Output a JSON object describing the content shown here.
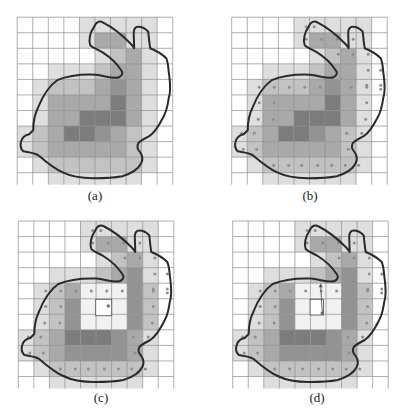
{
  "figure": {
    "grid": {
      "cols": 10,
      "rows": 11,
      "cell_size": 15.55
    },
    "shade_colors": [
      "#ffffff",
      "#dedede",
      "#c2c2c2",
      "#a9a9a9",
      "#939393",
      "#7c7c7c"
    ],
    "outline_color": "#2a2a2a",
    "dot_color": "#9a8a8a",
    "grid_line_color": "#8c8c8c",
    "panels": [
      {
        "id": "a",
        "label": "(a)",
        "origin": [
          17.2,
          17.2
        ],
        "dots": false
      },
      {
        "id": "b",
        "label": "(b)",
        "origin": [
          231.7,
          17.2
        ],
        "dots": true
      },
      {
        "id": "c",
        "label": "(c)",
        "origin": [
          18.3,
          221
        ],
        "dots": true,
        "hole": true,
        "box": true
      },
      {
        "id": "d",
        "label": "(d)",
        "origin": [
          232.7,
          221
        ],
        "dots": true,
        "hole": true,
        "box": true,
        "arrow": true
      }
    ],
    "shading_full": [
      [
        0,
        0,
        0,
        0,
        1,
        1,
        1,
        1,
        1,
        0
      ],
      [
        0,
        0,
        0,
        0,
        1,
        3,
        3,
        1,
        1,
        0
      ],
      [
        0,
        0,
        0,
        0,
        0,
        1,
        2,
        3,
        1,
        0
      ],
      [
        0,
        0,
        1,
        1,
        1,
        2,
        3,
        3,
        1,
        0
      ],
      [
        0,
        1,
        2,
        2,
        2,
        3,
        4,
        3,
        1,
        0
      ],
      [
        0,
        1,
        3,
        3,
        3,
        3,
        5,
        3,
        1,
        0
      ],
      [
        0,
        1,
        3,
        3,
        5,
        5,
        5,
        3,
        1,
        0
      ],
      [
        1,
        2,
        3,
        5,
        5,
        4,
        3,
        2,
        1,
        0
      ],
      [
        1,
        2,
        3,
        3,
        3,
        3,
        3,
        2,
        1,
        0
      ],
      [
        0,
        1,
        2,
        2,
        2,
        2,
        2,
        2,
        1,
        0
      ],
      [
        0,
        0,
        1,
        1,
        1,
        1,
        1,
        1,
        0,
        0
      ]
    ],
    "shading_hollow": [
      [
        0,
        0,
        0,
        0,
        1,
        1,
        1,
        1,
        1,
        0
      ],
      [
        0,
        0,
        0,
        0,
        1,
        3,
        3,
        1,
        1,
        0
      ],
      [
        0,
        0,
        0,
        0,
        0,
        1,
        2,
        3,
        1,
        0
      ],
      [
        0,
        0,
        1,
        1,
        1,
        2,
        3,
        4,
        1,
        0
      ],
      [
        0,
        1,
        2,
        3,
        0,
        0,
        0,
        4,
        2,
        0
      ],
      [
        0,
        1,
        2,
        4,
        0,
        0,
        0,
        4,
        2,
        0
      ],
      [
        0,
        1,
        2,
        4,
        0,
        0,
        0,
        4,
        2,
        0
      ],
      [
        1,
        2,
        3,
        5,
        5,
        5,
        4,
        3,
        1,
        0
      ],
      [
        1,
        2,
        3,
        4,
        4,
        4,
        4,
        3,
        1,
        0
      ],
      [
        0,
        1,
        2,
        2,
        2,
        2,
        2,
        2,
        1,
        0
      ],
      [
        0,
        0,
        1,
        1,
        1,
        1,
        1,
        1,
        0,
        0
      ]
    ],
    "hole_tint": "#f1f1f1",
    "dots_local": [
      [
        74.5,
        9.5
      ],
      [
        82.5,
        9.5
      ],
      [
        74.5,
        22
      ],
      [
        90,
        22
      ],
      [
        105.5,
        22
      ],
      [
        121.5,
        22
      ],
      [
        106.5,
        37
      ],
      [
        121.5,
        37
      ],
      [
        136.5,
        37
      ],
      [
        136.5,
        53
      ],
      [
        149,
        53
      ],
      [
        135,
        68
      ],
      [
        149,
        68
      ],
      [
        27.5,
        70
      ],
      [
        42.5,
        70
      ],
      [
        57.5,
        70
      ],
      [
        73,
        70
      ],
      [
        88.5,
        70
      ],
      [
        104,
        70
      ],
      [
        119.5,
        70
      ],
      [
        135,
        70
      ],
      [
        149,
        72
      ],
      [
        27.5,
        85.5
      ],
      [
        42.5,
        85.5
      ],
      [
        135,
        85.5
      ],
      [
        26.5,
        102
      ],
      [
        41.5,
        102
      ],
      [
        134,
        102
      ],
      [
        10,
        116
      ],
      [
        22.5,
        116
      ],
      [
        115,
        116
      ],
      [
        130,
        116
      ],
      [
        11.5,
        132
      ],
      [
        25,
        132
      ],
      [
        116.5,
        132
      ],
      [
        42,
        148
      ],
      [
        57,
        148
      ],
      [
        70,
        148
      ],
      [
        86,
        148
      ],
      [
        100,
        148
      ],
      [
        113.5,
        148
      ],
      [
        127,
        148
      ]
    ],
    "box_c": {
      "x": 77.4,
      "y": 78.3,
      "w": 16,
      "h": 16.4,
      "dot": [
        90,
        85
      ]
    },
    "box_d": {
      "x": 77.4,
      "y": 78.3,
      "w": 13.3,
      "h": 15.7,
      "dot": [
        89.6,
        92.3
      ],
      "arrow_to": [
        88,
        62.3
      ]
    },
    "outline_path_local": "M 77 9.5 C 79 4 83 3.5 86 5.5 C 95 10 104 17 113 26 C 116 29 117 31 117 31 L 116.5 16 C 116.5 11 118 9.5 121 9.5 C 125 9.5 128 11 131 14.5 C 131.5 20 132 25 133 31 C 138 33 145 37 149 41 C 151.5 47 151 53 152 58 C 153 66 154 74 151.5 81 C 150.5 87 150 93 146 100 C 142 108 138 115 132 119 C 128 121 124 123 121 126 C 119 130 121 133 123 135 C 125 138 126 142 124 146 C 121 152 115 156 105 159 C 95 161 86 161 76 161 C 63 161 53 159 45 155 C 36 151 28 144 21 138 C 16 135 10 135 6 134 C 3 131 3 127 4 124 C 5 120 7 118 12 117 L 16 113 C 16 106 17 98 21 90 C 25 80 30 70 40 63 C 52 58 64 57 78 57.5 C 88 58.5 96 62 102 60 C 106 58 105.5 55 104 53 C 100 47 93 40 85 35 C 80 32 76 31 73 28 C 71 23 73 15 77 9.5 Z"
  }
}
